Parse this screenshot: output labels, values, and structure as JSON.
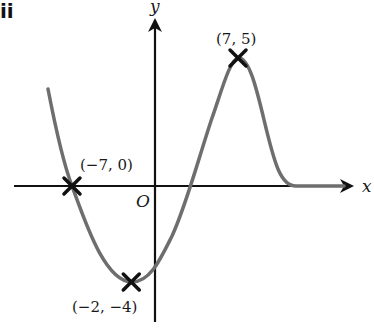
{
  "diagram": {
    "corner_mark": "ii",
    "axes": {
      "x_label": "x",
      "y_label": "y",
      "origin_label": "O",
      "axis_color": "#111111"
    },
    "curve": {
      "color": "#6e6e6e",
      "description": "Graph of a function: decreasing from upper-left, crossing the x-axis at (-7, 0), minimum at (-2, -4), rising through the positive x-axis to a maximum at (7, 5), then decreasing and levelling off along the x-axis"
    },
    "points": [
      {
        "x": -7,
        "y": 0,
        "label": "(−7, 0)"
      },
      {
        "x": -2,
        "y": -4,
        "label": "(−2, −4)"
      },
      {
        "x": 7,
        "y": 5,
        "label": "(7, 5)"
      }
    ],
    "marker": "cross",
    "marker_color": "#111111"
  }
}
